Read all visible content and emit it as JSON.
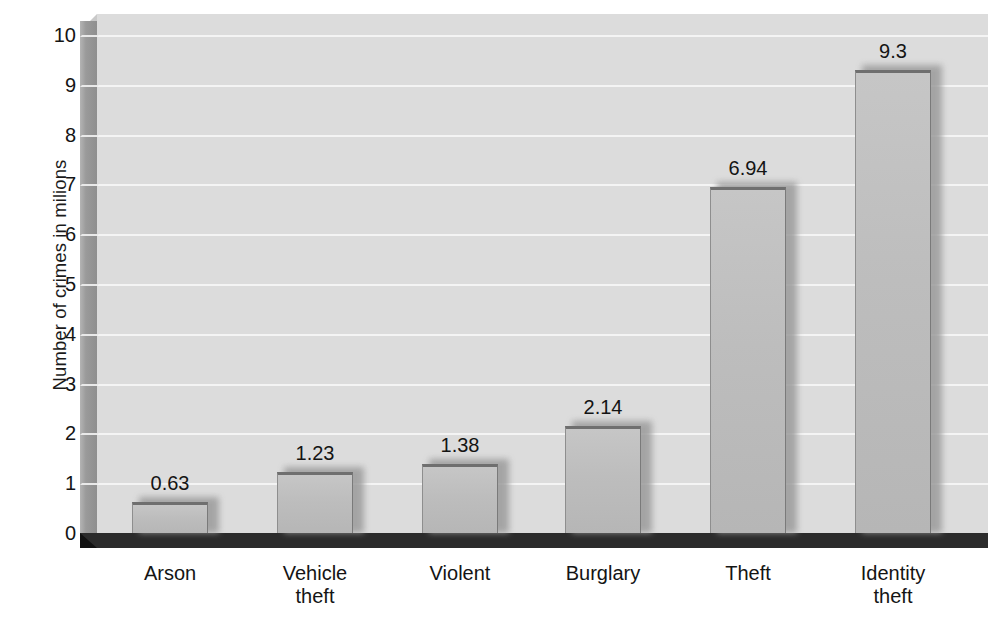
{
  "chart_data": {
    "type": "bar",
    "title": "",
    "xlabel": "",
    "ylabel": "Number of crimes in milions",
    "categories": [
      "Arson",
      "Vehicle theft",
      "Violent",
      "Burglary",
      "Theft",
      "Identity theft"
    ],
    "category_lines": [
      [
        "Arson"
      ],
      [
        "Vehicle",
        "theft"
      ],
      [
        "Violent"
      ],
      [
        "Burglary"
      ],
      [
        "Theft"
      ],
      [
        "Identity",
        "theft"
      ]
    ],
    "values": [
      0.63,
      1.23,
      1.38,
      2.14,
      6.94,
      9.3
    ],
    "value_labels": [
      "0.63",
      "1.23",
      "1.38",
      "2.14",
      "6.94",
      "9.3"
    ],
    "ylim": [
      0,
      10.4
    ],
    "yticks": [
      0,
      1,
      2,
      3,
      4,
      5,
      6,
      7,
      8,
      9,
      10
    ],
    "ytick_labels": [
      "0",
      "1",
      "2",
      "3",
      "4",
      "5",
      "6",
      "7",
      "8",
      "9",
      "10"
    ],
    "grid": true,
    "legend": "none",
    "style": "3d-bar",
    "colors": {
      "plot_background": "#dcdcdc",
      "gridline": "#f4f4f4",
      "bar_face": "#bdbdbd",
      "bar_top_edge": "#6f6f6f",
      "left_wall": "#9a9a9a",
      "floor": "#2b2b2b",
      "text": "#141414",
      "page_background": "#ffffff"
    }
  }
}
